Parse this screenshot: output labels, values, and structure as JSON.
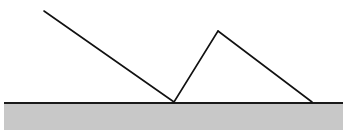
{
  "figure": {
    "type": "ray-diagram",
    "canvas": {
      "width": 348,
      "height": 130,
      "background_color": "#ffffff"
    },
    "surface": {
      "name": "ground-surface",
      "label": "reflecting surface",
      "fill_color": "#c8c8c8",
      "edge_color": "#1a1a1a",
      "edge_width": 2,
      "x_start": 4,
      "x_end": 343,
      "y_top": 102,
      "y_bottom": 130
    },
    "rays": {
      "stroke_color": "#111111",
      "stroke_width": 1.6,
      "incident": {
        "name": "incident-ray",
        "label": "incident ray",
        "from": {
          "x": 44,
          "y": 11
        },
        "to": {
          "x": 174,
          "y": 102
        }
      },
      "reflected_up": {
        "name": "reflected-ray-up",
        "label": "reflected ray rising to apex",
        "from": {
          "x": 174,
          "y": 102
        },
        "to": {
          "x": 218,
          "y": 31
        }
      },
      "descending": {
        "name": "descending-ray",
        "label": "ray descending from apex to surface",
        "from": {
          "x": 218,
          "y": 31
        },
        "to": {
          "x": 312,
          "y": 102
        }
      }
    },
    "points": {
      "ray_origin": {
        "name": "ray-origin-point",
        "label": "start of incident ray",
        "x": 44,
        "y": 11
      },
      "incidence": {
        "name": "incidence-point",
        "label": "point of incidence",
        "x": 174,
        "y": 102
      },
      "apex": {
        "name": "apex-point",
        "label": "apex / turning point",
        "x": 218,
        "y": 31
      },
      "landing": {
        "name": "landing-point",
        "label": "second contact with surface",
        "x": 312,
        "y": 102
      }
    }
  }
}
